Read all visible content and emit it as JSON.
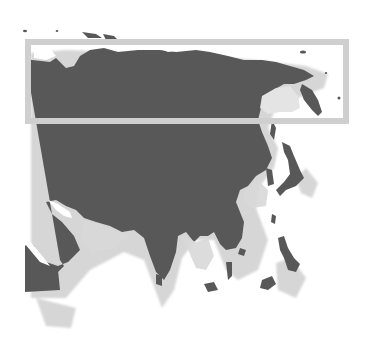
{
  "map": {
    "subject": "Asia",
    "style": "grayscale relief with drop shadow",
    "colors": {
      "background": "#ffffff",
      "land": "#585858",
      "land_edge": "#4a4a4a",
      "shadow": "#d4d4d4",
      "highlight_box": "#cfcfcf"
    },
    "highlight_region": {
      "label": "Northern Asia (Siberia)",
      "x": 25,
      "y": 40,
      "width": 323,
      "height": 83
    }
  }
}
